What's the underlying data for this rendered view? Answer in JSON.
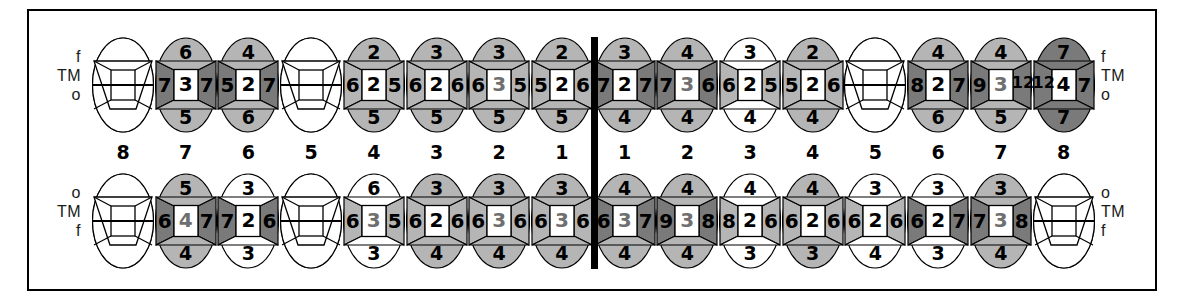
{
  "chart_data": {
    "type": "table",
    "row_labels": {
      "upper": [
        "f",
        "TM",
        "o"
      ],
      "lower": [
        "o",
        "TM",
        "f"
      ]
    },
    "tooth_numbers_left": [
      "8",
      "7",
      "6",
      "5",
      "4",
      "3",
      "2",
      "1"
    ],
    "tooth_numbers_right": [
      "1",
      "2",
      "3",
      "4",
      "5",
      "6",
      "7",
      "8"
    ],
    "legend": {
      "shade_light": "#b5b5b5",
      "shade_dark": "#7a7a7a",
      "shade_none": "#ffffff",
      "center_box": "#ffffff",
      "outline": "#000000",
      "midline": "#000000"
    },
    "upper_arch": [
      {
        "tooth": "8",
        "side": "left",
        "missing": true,
        "top": "",
        "bottom": "",
        "left": "",
        "mid": "",
        "right": "",
        "fill_wing": "none",
        "fill_cap": "none"
      },
      {
        "tooth": "7",
        "side": "left",
        "missing": false,
        "top": "6",
        "bottom": "5",
        "left": "7",
        "mid": "3",
        "right": "7",
        "fill_wing": "dark",
        "fill_cap": "light"
      },
      {
        "tooth": "6",
        "side": "left",
        "missing": false,
        "top": "4",
        "bottom": "6",
        "left": "5",
        "mid": "2",
        "right": "7",
        "fill_wing": "dark",
        "fill_cap": "light"
      },
      {
        "tooth": "5",
        "side": "left",
        "missing": true,
        "top": "",
        "bottom": "",
        "left": "",
        "mid": "",
        "right": "",
        "fill_wing": "none",
        "fill_cap": "none"
      },
      {
        "tooth": "4",
        "side": "left",
        "missing": false,
        "top": "2",
        "bottom": "5",
        "left": "6",
        "mid": "2",
        "right": "5",
        "fill_wing": "light",
        "fill_cap": "light"
      },
      {
        "tooth": "3",
        "side": "left",
        "missing": false,
        "top": "3",
        "bottom": "5",
        "left": "6",
        "mid": "2",
        "right": "6",
        "fill_wing": "light",
        "fill_cap": "light"
      },
      {
        "tooth": "2",
        "side": "left",
        "missing": false,
        "top": "3",
        "bottom": "5",
        "left": "6",
        "mid": "3",
        "right": "5",
        "fill_wing": "light",
        "fill_cap": "light",
        "mid_light": true
      },
      {
        "tooth": "1",
        "side": "left",
        "missing": false,
        "top": "2",
        "bottom": "5",
        "left": "5",
        "mid": "2",
        "right": "6",
        "fill_wing": "light",
        "fill_cap": "light"
      },
      {
        "tooth": "1",
        "side": "right",
        "missing": false,
        "top": "3",
        "bottom": "4",
        "left": "7",
        "mid": "2",
        "right": "7",
        "fill_wing": "dark",
        "fill_cap": "light"
      },
      {
        "tooth": "2",
        "side": "right",
        "missing": false,
        "top": "4",
        "bottom": "4",
        "left": "7",
        "mid": "3",
        "right": "6",
        "fill_wing": "dark",
        "fill_cap": "light",
        "mid_light": true
      },
      {
        "tooth": "3",
        "side": "right",
        "missing": false,
        "top": "3",
        "bottom": "4",
        "left": "6",
        "mid": "2",
        "right": "5",
        "fill_wing": "light",
        "fill_cap": "none"
      },
      {
        "tooth": "4",
        "side": "right",
        "missing": false,
        "top": "2",
        "bottom": "4",
        "left": "5",
        "mid": "2",
        "right": "6",
        "fill_wing": "light",
        "fill_cap": "light"
      },
      {
        "tooth": "5",
        "side": "right",
        "missing": true,
        "top": "",
        "bottom": "",
        "left": "",
        "mid": "",
        "right": "",
        "fill_wing": "none",
        "fill_cap": "none"
      },
      {
        "tooth": "6",
        "side": "right",
        "missing": false,
        "top": "4",
        "bottom": "6",
        "left": "8",
        "mid": "2",
        "right": "7",
        "fill_wing": "dark",
        "fill_cap": "light"
      },
      {
        "tooth": "7",
        "side": "right",
        "missing": false,
        "top": "4",
        "bottom": "5",
        "left": "9",
        "mid": "3",
        "right": "12",
        "fill_wing": "dark",
        "fill_cap": "light",
        "wide_right": true,
        "mid_light": true
      },
      {
        "tooth": "8",
        "side": "right",
        "missing": false,
        "top": "7",
        "bottom": "7",
        "left": "12",
        "mid": "4",
        "right": "7",
        "fill_wing": "dark",
        "fill_cap": "dark",
        "wide_left": true
      }
    ],
    "lower_arch": [
      {
        "tooth": "8",
        "side": "left",
        "missing": true,
        "top": "",
        "bottom": "",
        "left": "",
        "mid": "",
        "right": "",
        "fill_wing": "none",
        "fill_cap": "none"
      },
      {
        "tooth": "7",
        "side": "left",
        "missing": false,
        "top": "5",
        "bottom": "4",
        "left": "6",
        "mid": "4",
        "right": "7",
        "fill_wing": "dark",
        "fill_cap": "light",
        "mid_light": true
      },
      {
        "tooth": "6",
        "side": "left",
        "missing": false,
        "top": "3",
        "bottom": "3",
        "left": "7",
        "mid": "2",
        "right": "6",
        "fill_wing": "dark",
        "fill_cap": "none"
      },
      {
        "tooth": "5",
        "side": "left",
        "missing": true,
        "top": "",
        "bottom": "",
        "left": "",
        "mid": "",
        "right": "",
        "fill_wing": "none",
        "fill_cap": "none"
      },
      {
        "tooth": "4",
        "side": "left",
        "missing": false,
        "top": "6",
        "bottom": "3",
        "left": "6",
        "mid": "3",
        "right": "5",
        "fill_wing": "light",
        "fill_cap": "none",
        "mid_light": true
      },
      {
        "tooth": "3",
        "side": "left",
        "missing": false,
        "top": "3",
        "bottom": "4",
        "left": "6",
        "mid": "2",
        "right": "6",
        "fill_wing": "light",
        "fill_cap": "light"
      },
      {
        "tooth": "2",
        "side": "left",
        "missing": false,
        "top": "3",
        "bottom": "4",
        "left": "6",
        "mid": "3",
        "right": "6",
        "fill_wing": "light",
        "fill_cap": "light",
        "mid_light": true
      },
      {
        "tooth": "1",
        "side": "left",
        "missing": false,
        "top": "3",
        "bottom": "4",
        "left": "6",
        "mid": "3",
        "right": "6",
        "fill_wing": "light",
        "fill_cap": "light",
        "mid_light": true
      },
      {
        "tooth": "1",
        "side": "right",
        "missing": false,
        "top": "4",
        "bottom": "4",
        "left": "6",
        "mid": "3",
        "right": "7",
        "fill_wing": "dark",
        "fill_cap": "light",
        "mid_light": true
      },
      {
        "tooth": "2",
        "side": "right",
        "missing": false,
        "top": "4",
        "bottom": "4",
        "left": "9",
        "mid": "3",
        "right": "8",
        "fill_wing": "dark",
        "fill_cap": "light",
        "mid_light": true
      },
      {
        "tooth": "3",
        "side": "right",
        "missing": false,
        "top": "4",
        "bottom": "3",
        "left": "8",
        "mid": "2",
        "right": "6",
        "fill_wing": "light",
        "fill_cap": "none"
      },
      {
        "tooth": "4",
        "side": "right",
        "missing": false,
        "top": "4",
        "bottom": "3",
        "left": "6",
        "mid": "2",
        "right": "6",
        "fill_wing": "light",
        "fill_cap": "light"
      },
      {
        "tooth": "5",
        "side": "right",
        "missing": false,
        "top": "3",
        "bottom": "4",
        "left": "6",
        "mid": "2",
        "right": "6",
        "fill_wing": "light",
        "fill_cap": "none"
      },
      {
        "tooth": "6",
        "side": "right",
        "missing": false,
        "top": "3",
        "bottom": "3",
        "left": "6",
        "mid": "2",
        "right": "7",
        "fill_wing": "dark",
        "fill_cap": "none"
      },
      {
        "tooth": "7",
        "side": "right",
        "missing": false,
        "top": "3",
        "bottom": "4",
        "left": "7",
        "mid": "3",
        "right": "8",
        "fill_wing": "dark",
        "fill_cap": "light",
        "mid_light": true
      },
      {
        "tooth": "8",
        "side": "right",
        "missing": true,
        "top": "",
        "bottom": "",
        "left": "",
        "mid": "",
        "right": "",
        "fill_wing": "none",
        "fill_cap": "none"
      }
    ]
  }
}
